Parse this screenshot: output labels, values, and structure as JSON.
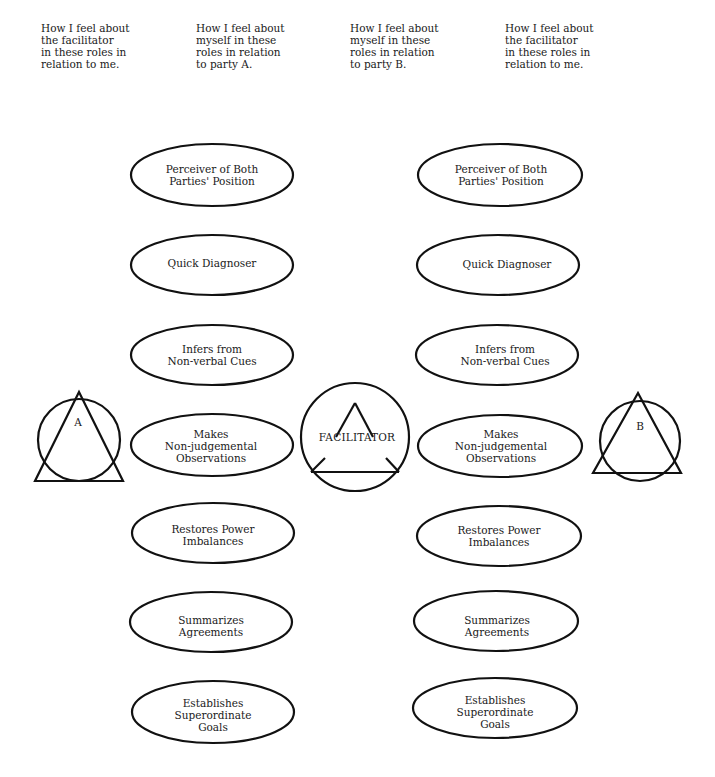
{
  "headers": [
    {
      "id": "col1",
      "text": "How I feel about\nthe facilitator\nin these roles in\nrelation to me.",
      "x": 41
    },
    {
      "id": "col2",
      "text": "How I feel about\nmyself in these\nroles in relation\nto party A.",
      "x": 196
    },
    {
      "id": "col3",
      "text": "How I feel about\nmyself in these\nroles in relation\nto party B.",
      "x": 350
    },
    {
      "id": "col4",
      "text": "How I feel about\nthe facilitator\nin these roles in\nrelation to me.",
      "x": 505
    }
  ],
  "roles": [
    {
      "label": "Perceiver of Both\nParties' Position",
      "y": 175
    },
    {
      "label": "Quick Diagnoser",
      "y": 265
    },
    {
      "label": "Infers from\nNon-verbal Cues",
      "y": 355
    },
    {
      "label": "Makes\nNon-judgemental\nObservations",
      "y": 444
    },
    {
      "label": "Restores Power\nImbalances",
      "y": 533
    },
    {
      "label": "Summarizes\nAgreements",
      "y": 622
    },
    {
      "label": "Establishes\nSuperordinate\nGoals",
      "y": 711
    }
  ],
  "columns": {
    "left_ellipse_cx": 212,
    "right_ellipse_cx": 499
  },
  "nodes": {
    "party_a": {
      "label": "A",
      "cx": 79,
      "cy": 440
    },
    "facilitator": {
      "label": "FACILITATOR",
      "cx": 355,
      "cy": 436
    },
    "party_b": {
      "label": "B",
      "cx": 639,
      "cy": 440
    }
  },
  "colors": {
    "stroke": "#111111",
    "background": "#ffffff"
  }
}
